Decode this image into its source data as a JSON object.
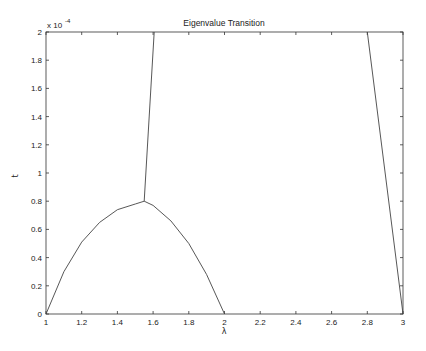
{
  "chart_data": {
    "type": "line",
    "title": "Eigenvalue Transition",
    "xlabel": "λ",
    "ylabel": "t",
    "y_exponent_label": "x 10",
    "y_exponent": "-4",
    "xlim": [
      1,
      3
    ],
    "ylim": [
      0,
      0.0002
    ],
    "grid": false,
    "legend": null,
    "x_ticks": [
      "1",
      "1.2",
      "1.4",
      "1.6",
      "1.8",
      "2",
      "2.2",
      "2.4",
      "2.6",
      "2.8",
      "3"
    ],
    "y_ticks": [
      "0",
      "0.2",
      "0.4",
      "0.6",
      "0.8",
      "1",
      "1.2",
      "1.4",
      "1.6",
      "1.8",
      "2"
    ],
    "series": [
      {
        "name": "left-arc",
        "x": [
          1.0,
          1.1,
          1.2,
          1.3,
          1.4,
          1.5,
          1.55
        ],
        "y": [
          0,
          3e-05,
          5.1e-05,
          6.5e-05,
          7.4e-05,
          7.8e-05,
          8e-05
        ]
      },
      {
        "name": "right-arc",
        "x": [
          1.55,
          1.6,
          1.7,
          1.8,
          1.9,
          2.0
        ],
        "y": [
          8e-05,
          7.7e-05,
          6.6e-05,
          5e-05,
          2.8e-05,
          0
        ]
      },
      {
        "name": "upper-branch",
        "x": [
          1.55,
          1.606
        ],
        "y": [
          8e-05,
          0.0002
        ]
      },
      {
        "name": "right-line",
        "x": [
          2.8,
          3.0
        ],
        "y": [
          0.0002,
          0
        ]
      }
    ]
  }
}
